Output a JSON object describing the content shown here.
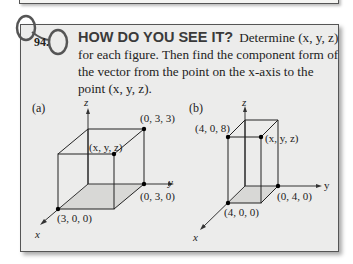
{
  "exercise": {
    "number": "94.",
    "heading": "HOW DO YOU SEE IT?",
    "body": "Determine (x, y, z) for each figure. Then find the component form of the vector from the point on the x-axis to the point (x, y, z)."
  },
  "figures": [
    {
      "label": "(a)",
      "axes": {
        "x": "x",
        "y": "y",
        "z": "z"
      },
      "points": [
        "(0, 3, 3)",
        "(x, y, z)",
        "(0, 3, 0)",
        "(3, 0, 0)"
      ]
    },
    {
      "label": "(b)",
      "axes": {
        "x": "x",
        "y": "y",
        "z": "z"
      },
      "points": [
        "(4, 0, 8)",
        "(x, y, z)",
        "(0, 4, 0)",
        "(4, 0, 0)"
      ]
    }
  ]
}
